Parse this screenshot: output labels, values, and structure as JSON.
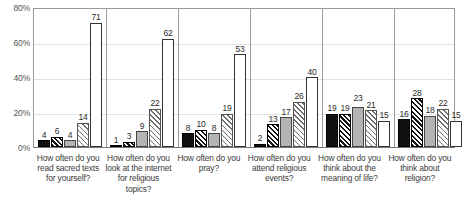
{
  "chart_data": {
    "type": "bar",
    "title": "",
    "xlabel": "",
    "ylabel": "",
    "ylim": [
      0,
      80
    ],
    "grid": true,
    "legend_position": "none",
    "ytick_labels": [
      "0%",
      "20%",
      "40%",
      "60%",
      "80%"
    ],
    "ytick_values": [
      0,
      20,
      40,
      60,
      80
    ],
    "categories": [
      "How often do you read sacred texts for yourself?",
      "How often do you look at the internet for religious topics?",
      "How often do you pray?",
      "How often do you attend religious events?",
      "How often do you think about the meaning of life?",
      "How often do you think about religion?"
    ],
    "series": [
      {
        "name": "series-1",
        "pattern": "solid-black",
        "values": [
          4,
          1,
          8,
          2,
          19,
          16
        ]
      },
      {
        "name": "series-2",
        "pattern": "dense-hatch",
        "values": [
          6,
          3,
          10,
          13,
          19,
          28
        ]
      },
      {
        "name": "series-3",
        "pattern": "solid-gray",
        "values": [
          4,
          9,
          8,
          17,
          23,
          18
        ]
      },
      {
        "name": "series-4",
        "pattern": "light-hatch",
        "values": [
          14,
          22,
          19,
          26,
          21,
          22
        ]
      },
      {
        "name": "series-5",
        "pattern": "white-outline",
        "values": [
          71,
          62,
          53,
          40,
          15,
          15
        ]
      }
    ]
  }
}
